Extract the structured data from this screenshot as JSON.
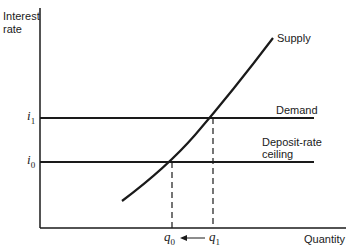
{
  "axes": {
    "y_label_line1": "Interest",
    "y_label_line2": "rate",
    "x_label": "Quantity"
  },
  "y_ticks": {
    "i1": {
      "base": "i",
      "sub": "1"
    },
    "i0": {
      "base": "i",
      "sub": "0"
    }
  },
  "x_ticks": {
    "q0": {
      "base": "q",
      "sub": "0"
    },
    "q1": {
      "base": "q",
      "sub": "1"
    },
    "arrow": "←—"
  },
  "curves": {
    "supply": "Supply",
    "demand": "Demand",
    "ceiling_line1": "Deposit-rate",
    "ceiling_line2": "ceiling"
  },
  "colors": {
    "ink": "#1a1a1a",
    "background": "#ffffff"
  }
}
